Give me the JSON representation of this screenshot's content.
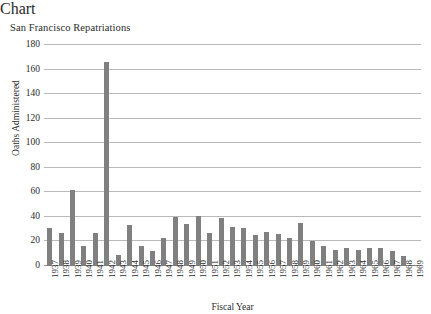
{
  "chart_data": {
    "type": "bar",
    "title": "San Francisco Repatriations",
    "xlabel": "Fiscal Year",
    "ylabel": "Oaths Administered",
    "ylim": [
      0,
      180
    ],
    "ytick_step": 20,
    "yticks": [
      180,
      160,
      140,
      120,
      100,
      80,
      60,
      40,
      20,
      0
    ],
    "grid": true,
    "legend": "none",
    "bar_color": "#808080",
    "gridline_color": "#b9b9b9",
    "categories": [
      "1937",
      "1938",
      "1939",
      "1940",
      "1941",
      "1942",
      "1943",
      "1944",
      "1945",
      "1946",
      "1947",
      "1948",
      "1949",
      "1950",
      "1951",
      "1952",
      "1953",
      "1954",
      "1955",
      "1956",
      "1957",
      "1958",
      "1959",
      "1960",
      "1961",
      "1962",
      "1963",
      "1964",
      "1965",
      "1966",
      "1967",
      "1968",
      "1969"
    ],
    "values": [
      31,
      27,
      62,
      16,
      27,
      166,
      9,
      33,
      16,
      12,
      23,
      40,
      34,
      41,
      27,
      39,
      32,
      31,
      25,
      28,
      26,
      23,
      35,
      20,
      16,
      13,
      15,
      13,
      15,
      15,
      12,
      8,
      1
    ]
  }
}
